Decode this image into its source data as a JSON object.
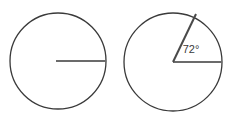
{
  "figure": {
    "background_color": "#ffffff",
    "title": "",
    "outline_color": "#3a3a3a",
    "radius_color": "#6b6b6b",
    "label_color": "#3a3a3a",
    "shapes": [
      {
        "name": "plain-circle",
        "center_x": 58,
        "center_y": 61,
        "radius": 48,
        "stroke_width": 1.3,
        "radii": [
          {
            "name": "horizontal-radius",
            "angle_deg": 0,
            "from_x": 56,
            "from_y": 61,
            "to_x": 106,
            "to_y": 61,
            "stroke_width": 2
          }
        ],
        "label": ""
      },
      {
        "name": "sector-circle",
        "center_x": 173,
        "center_y": 62,
        "radius": 49,
        "stroke_width": 1.3,
        "radii": [
          {
            "name": "horizontal-radius",
            "angle_deg": 0,
            "from_x": 173,
            "from_y": 62,
            "to_x": 222,
            "to_y": 62,
            "stroke_width": 2
          },
          {
            "name": "slanted-radius",
            "angle_deg": 64,
            "from_x": 173,
            "from_y": 62,
            "to_x": 196,
            "to_y": 14,
            "stroke_width": 2
          }
        ],
        "label": "72°"
      }
    ]
  },
  "labels": {
    "angle_value": "72°",
    "angle_label_x": 196,
    "angle_label_y": 50
  }
}
